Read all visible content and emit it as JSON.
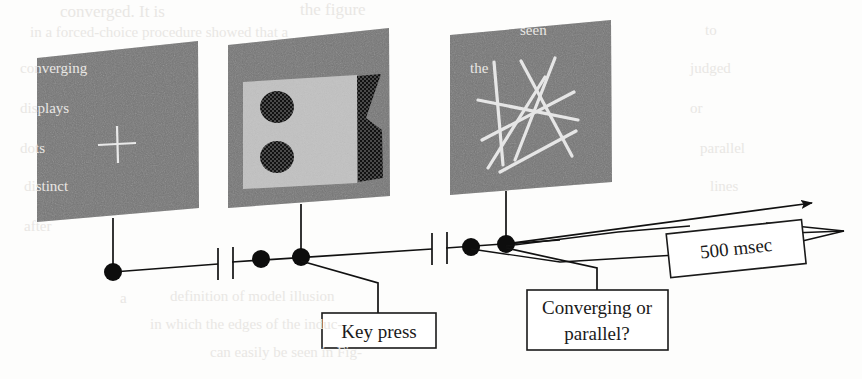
{
  "figure": {
    "background_color": "#fdfdfc",
    "panel_color": "#7a7a7a",
    "ink_color": "#111111"
  },
  "panels": [
    {
      "id": "fixation",
      "name": "fixation-panel",
      "content": "white fixation cross on gray noise field",
      "fixation_mark": "+"
    },
    {
      "id": "prime",
      "name": "prime-panel",
      "content": "light gray rectangle with two dark textured discs and a dark textured hourglass shape"
    },
    {
      "id": "test",
      "name": "test-panel",
      "content": "seven white line segments crossing on gray noise field"
    }
  ],
  "timeline": {
    "name": "trial-timeline",
    "break_marks": 2,
    "event_dots": 5,
    "arrow_head": "right"
  },
  "labels": {
    "key_press": "Key press",
    "question_line1": "Converging or",
    "question_line2": "parallel?",
    "duration": "500 msec"
  },
  "ghost_text": [
    {
      "text": "converged. It is",
      "x": 60,
      "y": 2,
      "size": 17
    },
    {
      "text": "the  figure",
      "x": 300,
      "y": 0,
      "size": 17
    },
    {
      "text": "in a  forced-choice  procedure  showed  that  a",
      "x": 30,
      "y": 24,
      "size": 15
    },
    {
      "text": "seen",
      "x": 520,
      "y": 22,
      "size": 15
    },
    {
      "text": "to",
      "x": 705,
      "y": 22,
      "size": 15
    },
    {
      "text": "converging",
      "x": 20,
      "y": 60,
      "size": 15
    },
    {
      "text": "the",
      "x": 470,
      "y": 60,
      "size": 15
    },
    {
      "text": "judged",
      "x": 690,
      "y": 60,
      "size": 15
    },
    {
      "text": "displays",
      "x": 20,
      "y": 100,
      "size": 15
    },
    {
      "text": "or",
      "x": 690,
      "y": 100,
      "size": 15
    },
    {
      "text": "dots",
      "x": 20,
      "y": 140,
      "size": 15
    },
    {
      "text": "parallel",
      "x": 700,
      "y": 140,
      "size": 15
    },
    {
      "text": "distinct",
      "x": 24,
      "y": 178,
      "size": 15
    },
    {
      "text": "lines",
      "x": 710,
      "y": 178,
      "size": 15
    },
    {
      "text": "after",
      "x": 24,
      "y": 218,
      "size": 15
    },
    {
      "text": "a",
      "x": 120,
      "y": 290,
      "size": 15
    },
    {
      "text": "definition of  model  illusion",
      "x": 170,
      "y": 288,
      "size": 15
    },
    {
      "text": "in which  the  edges  of  the  induc-",
      "x": 150,
      "y": 316,
      "size": 15
    },
    {
      "text": "can  easily  be  seen  in  Fig-",
      "x": 210,
      "y": 344,
      "size": 15
    }
  ]
}
